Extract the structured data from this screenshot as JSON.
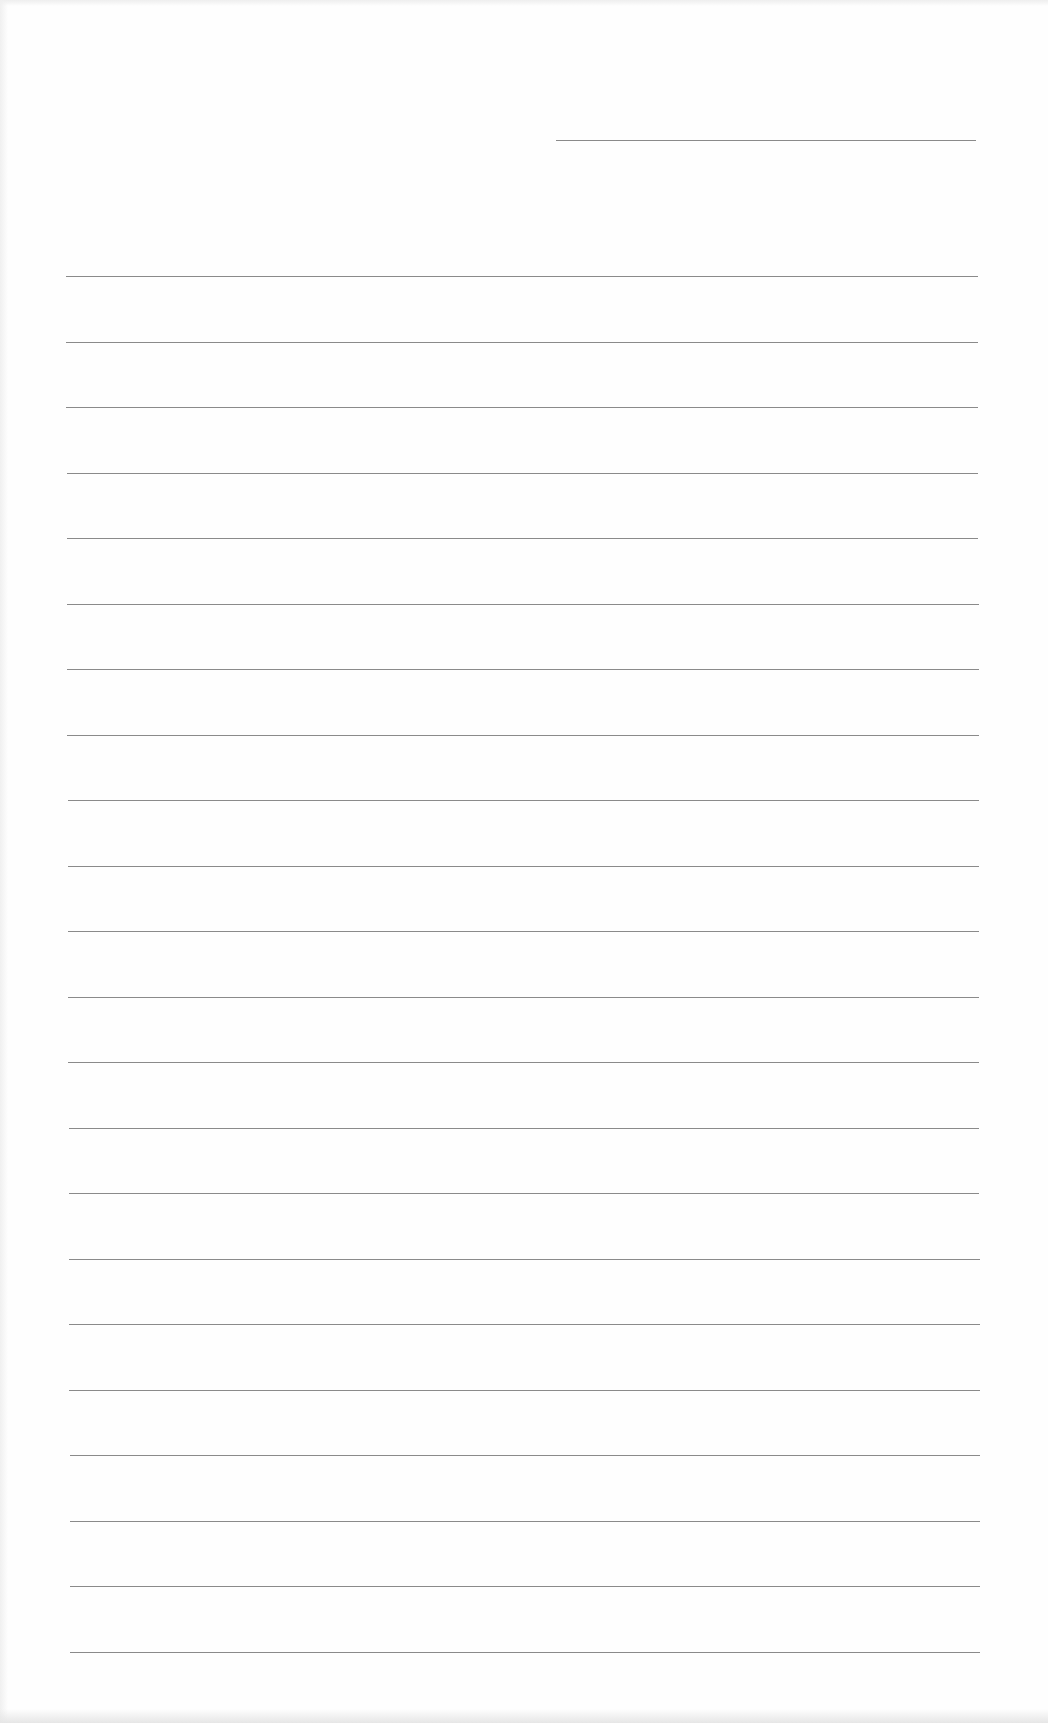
{
  "page": {
    "type": "lined-paper",
    "background_color": "#fefefe",
    "rule_color": "#8a8a8a"
  },
  "header_line": {
    "x": 556,
    "y": 140,
    "width": 420
  },
  "ruled_lines": {
    "count": 22,
    "first_y": 276,
    "spacing": 65.5,
    "left": 66,
    "right": 978
  }
}
